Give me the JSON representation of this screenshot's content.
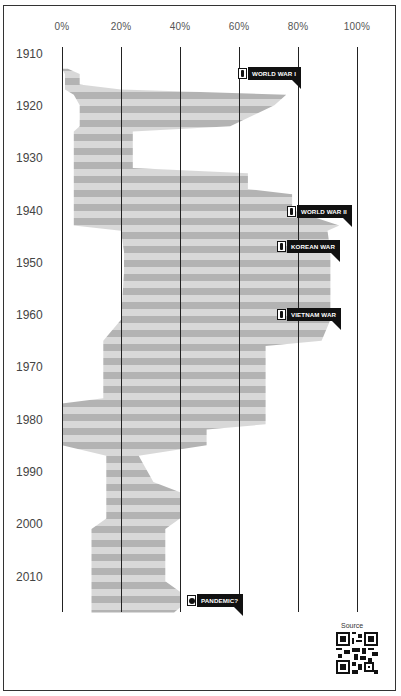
{
  "chart_data": {
    "type": "area",
    "title": "",
    "orientation": "vertical-time",
    "xlabel": "",
    "ylabel": "",
    "x_ticks": [
      "0%",
      "20%",
      "40%",
      "60%",
      "80%",
      "100%"
    ],
    "y_ticks": [
      "1910",
      "1920",
      "1930",
      "1940",
      "1950",
      "1960",
      "1970",
      "1980",
      "1990",
      "2000",
      "2010"
    ],
    "xlim": [
      0,
      100
    ],
    "ylim": [
      1910,
      2018
    ],
    "grid": "vertical lines at each 20%",
    "style": "horizontal gray stripes (alternating dark/light)",
    "series": [
      {
        "name": "band",
        "points": [
          {
            "year": 1913,
            "left": 0,
            "right": 2
          },
          {
            "year": 1914,
            "left": 1,
            "right": 6
          },
          {
            "year": 1916,
            "left": 1,
            "right": 6
          },
          {
            "year": 1917,
            "left": 1,
            "right": 20
          },
          {
            "year": 1918,
            "left": 4,
            "right": 76
          },
          {
            "year": 1920,
            "left": 6,
            "right": 72
          },
          {
            "year": 1924,
            "left": 6,
            "right": 57
          },
          {
            "year": 1925,
            "left": 4,
            "right": 24
          },
          {
            "year": 1932,
            "left": 4,
            "right": 24
          },
          {
            "year": 1933,
            "left": 4,
            "right": 63
          },
          {
            "year": 1936,
            "left": 4,
            "right": 63
          },
          {
            "year": 1937,
            "left": 4,
            "right": 78
          },
          {
            "year": 1940,
            "left": 4,
            "right": 78
          },
          {
            "year": 1943,
            "left": 4,
            "right": 94
          },
          {
            "year": 1944,
            "left": 20,
            "right": 90
          },
          {
            "year": 1948,
            "left": 21,
            "right": 91
          },
          {
            "year": 1952,
            "left": 21,
            "right": 91
          },
          {
            "year": 1961,
            "left": 20,
            "right": 91
          },
          {
            "year": 1965,
            "left": 14,
            "right": 88
          },
          {
            "year": 1966,
            "left": 14,
            "right": 69
          },
          {
            "year": 1976,
            "left": 14,
            "right": 69
          },
          {
            "year": 1977,
            "left": 0,
            "right": 69
          },
          {
            "year": 1981,
            "left": 0,
            "right": 69
          },
          {
            "year": 1982,
            "left": 0,
            "right": 49
          },
          {
            "year": 1985,
            "left": 0,
            "right": 49
          },
          {
            "year": 1987,
            "left": 15,
            "right": 26
          },
          {
            "year": 1992,
            "left": 15,
            "right": 31
          },
          {
            "year": 1994,
            "left": 15,
            "right": 40
          },
          {
            "year": 1999,
            "left": 15,
            "right": 40
          },
          {
            "year": 2001,
            "left": 10,
            "right": 35
          },
          {
            "year": 2011,
            "left": 10,
            "right": 35
          },
          {
            "year": 2013,
            "left": 10,
            "right": 40
          },
          {
            "year": 2016,
            "left": 10,
            "right": 40
          },
          {
            "year": 2017,
            "left": 10,
            "right": 38
          }
        ]
      }
    ],
    "annotations": [
      {
        "label": "WORLD WAR I",
        "year": 1917,
        "x_pct": 80,
        "icon": "soldier"
      },
      {
        "label": "WORLD WAR II",
        "year": 1942,
        "x_pct": 96,
        "icon": "soldier"
      },
      {
        "label": "KOREAN WAR",
        "year": 1949,
        "x_pct": 91,
        "icon": "soldier"
      },
      {
        "label": "VIETNAM WAR",
        "year": 1962,
        "x_pct": 91,
        "icon": "soldier"
      },
      {
        "label": "PANDEMIC?",
        "year": 2017,
        "x_pct": 60,
        "icon": "virus"
      }
    ]
  },
  "axis": {
    "x": [
      "0%",
      "20%",
      "40%",
      "60%",
      "80%",
      "100%"
    ],
    "y": [
      "1910",
      "1920",
      "1930",
      "1940",
      "1950",
      "1960",
      "1970",
      "1980",
      "1990",
      "2000",
      "2010"
    ]
  },
  "markers": {
    "ww1": "WORLD WAR I",
    "ww2": "WORLD WAR II",
    "korea": "KOREAN WAR",
    "vietnam": "VIETNAM WAR",
    "pandemic": "PANDEMIC?"
  },
  "footer": {
    "source_label": "Source"
  },
  "colors": {
    "stripe_dark": "#b3b3b3",
    "stripe_light": "#d8d8d8",
    "marker": "#111111",
    "gridline": "#222222"
  }
}
